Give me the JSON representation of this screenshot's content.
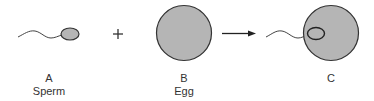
{
  "colors": {
    "cell_fill": "#b5b5b5",
    "stroke": "#333333",
    "text": "#333333"
  },
  "stages": [
    {
      "letter": "A",
      "name": "Sperm"
    },
    {
      "letter": "B",
      "name": "Egg"
    },
    {
      "letter": "C",
      "name": ""
    }
  ],
  "operators": {
    "plus": "+",
    "arrow": "→"
  }
}
